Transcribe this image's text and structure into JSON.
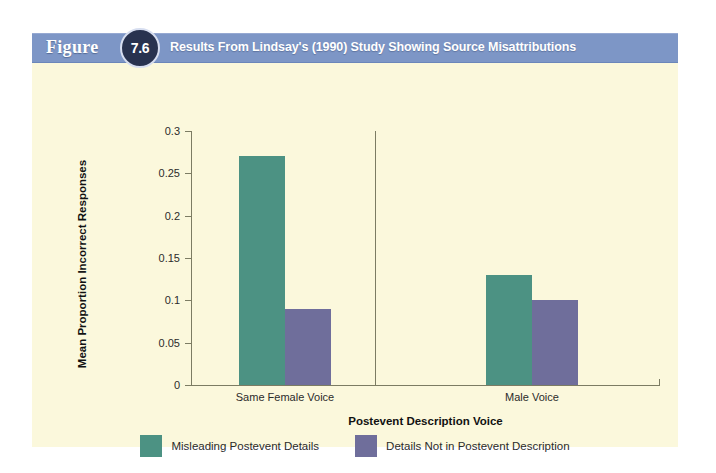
{
  "figure": {
    "label": "Figure",
    "number": "7.6",
    "title": "Results From Lindsay's (1990) Study Showing Source Misattributions",
    "header_color": "#7d96c6",
    "badge_color": "#28324f",
    "panel_background": "#fbf8dc"
  },
  "chart_data": {
    "type": "bar",
    "title": "Results From Lindsay's (1990) Study Showing Source Misattributions",
    "xlabel": "Postevent Description Voice",
    "ylabel": "Mean Proportion Incorrect Responses",
    "categories": [
      "Same Female Voice",
      "Male Voice"
    ],
    "series": [
      {
        "name": "Misleading Postevent Details",
        "color": "#4c9283",
        "values": [
          0.27,
          0.13
        ]
      },
      {
        "name": "Details Not in Postevent Description",
        "color": "#6f6e9b",
        "values": [
          0.09,
          0.1
        ]
      }
    ],
    "ylim": [
      0,
      0.3
    ],
    "yticks": [
      0,
      0.05,
      0.1,
      0.15,
      0.2,
      0.25,
      0.3
    ],
    "ytick_labels": [
      "0",
      "0.05",
      "0.1",
      "0.15",
      "0.2",
      "0.25",
      "0.3"
    ],
    "grid": false,
    "legend_position": "bottom",
    "group_divider": true
  }
}
